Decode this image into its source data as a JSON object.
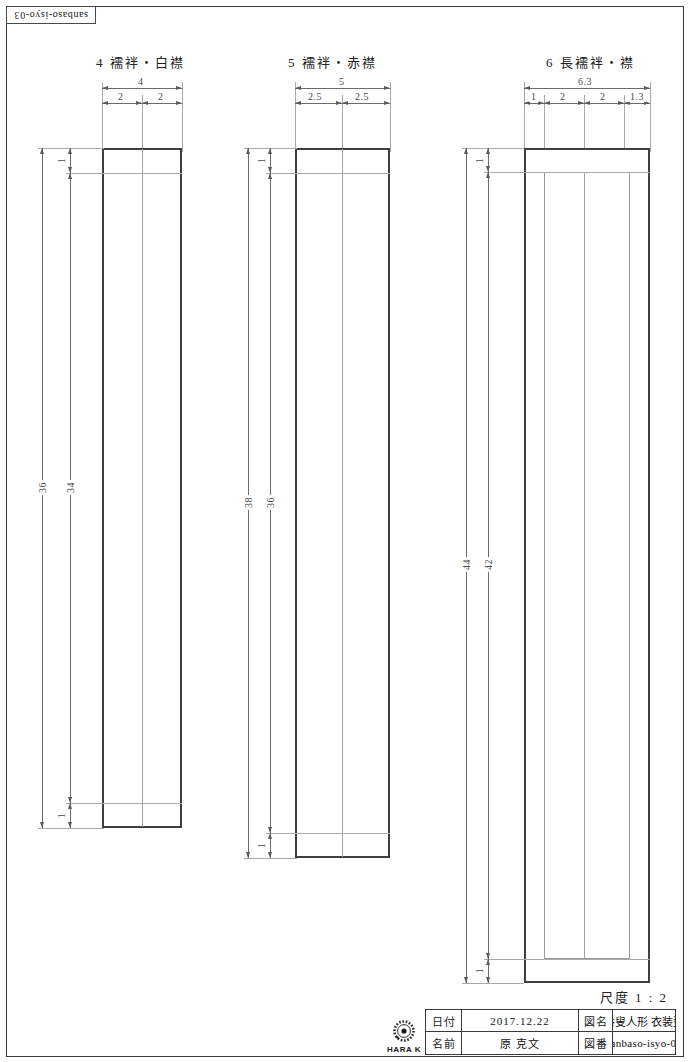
{
  "sheet": {
    "code": "sanbaso-isyo-03",
    "scale_label": "尺度  1 : 2"
  },
  "figures": [
    {
      "id": "fig-4",
      "title": "4  襦袢・白襟",
      "top_dims": [
        "4",
        "2",
        "2"
      ],
      "left_dims": [
        "36",
        "34"
      ],
      "detail_dims": [
        "1",
        "1"
      ]
    },
    {
      "id": "fig-5",
      "title": "5  襦袢・赤襟",
      "top_dims": [
        "5",
        "2.5",
        "2.5"
      ],
      "left_dims": [
        "38",
        "36"
      ],
      "detail_dims": [
        "1",
        "1"
      ]
    },
    {
      "id": "fig-6",
      "title": "6  長襦袢・襟",
      "top_dims": [
        "6.3",
        "1",
        "2",
        "2",
        "1.3"
      ],
      "left_dims": [
        "44",
        "42"
      ],
      "detail_dims": [
        "1",
        "1"
      ]
    }
  ],
  "title_block": {
    "date_label": "日付",
    "date_value": "2017.12.22",
    "drawing_name_label": "図名",
    "drawing_name_value": "三番叟人形 衣装型紙",
    "name_label": "名前",
    "name_value": "原  克文",
    "drawing_no_label": "図番",
    "drawing_no_value": "sanbaso-isyo-03"
  },
  "logo": {
    "text": "HARA K",
    "icon": "starburst-icon"
  },
  "colors": {
    "outline": "#3f3f3f",
    "dimension": "#6b6b6b",
    "frame": "#3a3a3a"
  }
}
